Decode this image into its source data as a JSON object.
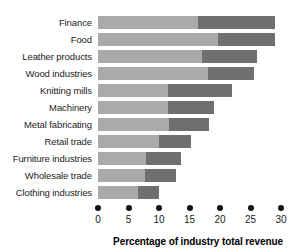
{
  "chart_data": {
    "type": "bar",
    "orientation": "horizontal",
    "stacked": true,
    "title": "",
    "xlabel": "Percentage of industry total revenue",
    "ylabel": "",
    "xlim": [
      0,
      30
    ],
    "xticks": [
      0,
      5,
      10,
      15,
      20,
      25,
      30
    ],
    "grid": false,
    "legend": "none",
    "categories": [
      "Finance",
      "Food",
      "Leather products",
      "Wood industries",
      "Knitting mills",
      "Machinery",
      "Metal fabricating",
      "Retail trade",
      "Furniture industries",
      "Wholesale trade",
      "Clothing industries"
    ],
    "series": [
      {
        "name": "segment-1",
        "color": "#aaaaaa",
        "values": [
          16.4,
          19.7,
          17.0,
          18.0,
          11.5,
          11.5,
          11.7,
          10.0,
          7.9,
          7.7,
          6.6
        ]
      },
      {
        "name": "segment-2",
        "color": "#6f6f6f",
        "values": [
          12.6,
          9.3,
          9.0,
          7.5,
          10.5,
          7.5,
          6.5,
          5.2,
          5.7,
          5.1,
          3.4
        ]
      }
    ],
    "totals": [
      29.0,
      29.0,
      26.0,
      25.5,
      22.0,
      19.0,
      18.2,
      15.2,
      13.6,
      12.8,
      10.0
    ]
  },
  "axis": {
    "ticks": [
      "0",
      "5",
      "10",
      "15",
      "20",
      "25",
      "30"
    ],
    "title": "Percentage of industry total revenue"
  },
  "colors": {
    "segment_light": "#aaaaaa",
    "segment_dark": "#6f6f6f",
    "text": "#1c1c1c",
    "background": "#ffffff"
  }
}
